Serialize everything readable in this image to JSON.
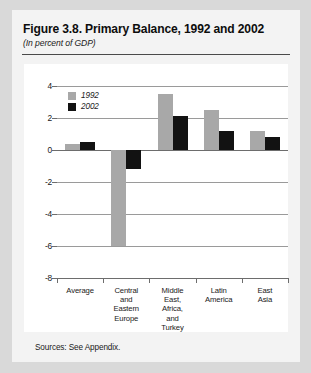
{
  "figure": {
    "title": "Figure 3.8. Primary Balance, 1992 and 2002",
    "subtitle": "(In percent of GDP)",
    "source_note": "Sources: See Appendix."
  },
  "colors": {
    "series_1992": "#a8a8a8",
    "series_2002": "#121212",
    "page_background": "#d9d9d9",
    "figure_background": "#f3f3f3",
    "plot_background": "#ffffff",
    "gridline": "#9a9a9a",
    "axis": "#6d6d6d"
  },
  "legend": {
    "position": "top-left-inside",
    "entries": [
      {
        "label": "1992",
        "swatch": "#a8a8a8"
      },
      {
        "label": "2002",
        "swatch": "#121212"
      }
    ]
  },
  "chart_data": {
    "type": "bar",
    "title": "Figure 3.8. Primary Balance, 1992 and 2002",
    "subtitle": "(In percent of GDP)",
    "xlabel": "",
    "ylabel": "",
    "ylim": [
      -8,
      4
    ],
    "yticks": [
      4,
      2,
      0,
      -2,
      -4,
      -6,
      -8
    ],
    "ytick_labels": [
      "4",
      "2",
      "0",
      "-2",
      "-4",
      "-6",
      "-8"
    ],
    "grid": true,
    "grid_axis": "y",
    "categories": [
      "Average",
      "Central and Eastern Europe",
      "Middle East, Africa, and Turkey",
      "Latin America",
      "East Asia"
    ],
    "category_label_lines": [
      [
        "Average"
      ],
      [
        "Central",
        "and",
        "Eastern",
        "Europe"
      ],
      [
        "Middle",
        "East,",
        "Africa,",
        "and",
        "Turkey"
      ],
      [
        "Latin",
        "America"
      ],
      [
        "East",
        "Asia"
      ]
    ],
    "series": [
      {
        "name": "1992",
        "color": "#a8a8a8",
        "values": [
          0.4,
          -6.0,
          3.5,
          2.5,
          1.2
        ]
      },
      {
        "name": "2002",
        "color": "#121212",
        "values": [
          0.5,
          -1.2,
          2.1,
          1.2,
          0.8
        ]
      }
    ]
  }
}
